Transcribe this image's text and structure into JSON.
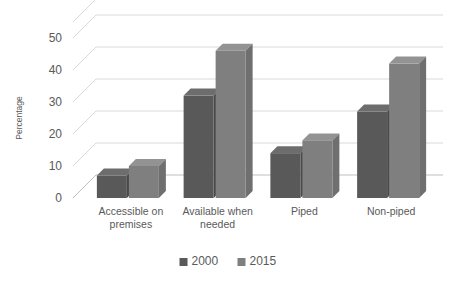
{
  "chart_data": {
    "type": "bar",
    "title": "",
    "subtitle": "",
    "xlabel": "",
    "ylabel": "Percentage",
    "ylim": [
      0,
      50
    ],
    "yticks": [
      0,
      10,
      20,
      30,
      40,
      50
    ],
    "ytick_labels": [
      "0",
      "10",
      "20",
      "30",
      "40",
      "50"
    ],
    "grid": true,
    "legend_position": "bottom",
    "style": "3d-clustered-column",
    "categories": [
      "Accessible on premises",
      "Available when needed",
      "Piped",
      "Non-piped"
    ],
    "category_lines": [
      [
        "Accessible on",
        "premises"
      ],
      [
        "Available when",
        "needed"
      ],
      [
        "Piped"
      ],
      [
        "Non-piped"
      ]
    ],
    "series": [
      {
        "name": "2000",
        "color": "#595959",
        "values": [
          7,
          32,
          14,
          27
        ]
      },
      {
        "name": "2015",
        "color": "#7f7f7f",
        "values": [
          10,
          46,
          18,
          42
        ]
      }
    ]
  },
  "legend": {
    "items": [
      {
        "label": "2000",
        "color": "#595959"
      },
      {
        "label": "2015",
        "color": "#7f7f7f"
      }
    ]
  },
  "axes": {
    "y_title": "Percentage"
  },
  "colors": {
    "series_2000_front": "#595959",
    "series_2000_side": "#4a4a4a",
    "series_2000_top": "#6b6b6b",
    "series_2015_front": "#7f7f7f",
    "series_2015_side": "#6e6e6e",
    "series_2015_top": "#919191",
    "gridline": "#d9d9d9",
    "text": "#5a5a5a",
    "background": "#ffffff"
  }
}
